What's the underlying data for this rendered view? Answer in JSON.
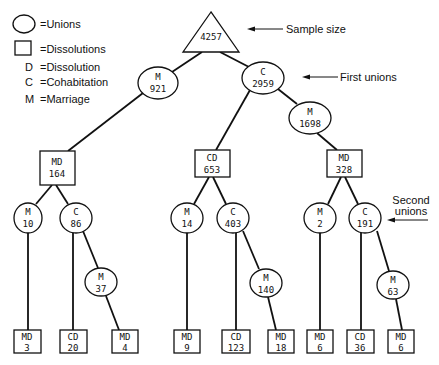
{
  "legend": {
    "unions": "=Unions",
    "dissolutions": "=Dissolutions",
    "d_letter": "D",
    "d_text": "=Dissolution",
    "c_letter": "C",
    "c_text": "=Cohabitation",
    "m_letter": "M",
    "m_text": "=Marriage"
  },
  "annotations": {
    "sample_size": "Sample size",
    "first_unions": "First unions",
    "second_unions_line1": "Second",
    "second_unions_line2": "unions"
  },
  "nodes": {
    "root": {
      "label": "4257"
    },
    "m921": {
      "type": "M",
      "count": "921"
    },
    "c2959": {
      "type": "C",
      "count": "2959"
    },
    "m1698": {
      "type": "M",
      "count": "1698"
    },
    "md164": {
      "type": "MD",
      "count": "164"
    },
    "cd653": {
      "type": "CD",
      "count": "653"
    },
    "md328": {
      "type": "MD",
      "count": "328"
    },
    "m10": {
      "type": "M",
      "count": "10"
    },
    "c86": {
      "type": "C",
      "count": "86"
    },
    "m37": {
      "type": "M",
      "count": "37"
    },
    "m14": {
      "type": "M",
      "count": "14"
    },
    "c403": {
      "type": "C",
      "count": "403"
    },
    "m140": {
      "type": "M",
      "count": "140"
    },
    "m2": {
      "type": "M",
      "count": "2"
    },
    "c191": {
      "type": "C",
      "count": "191"
    },
    "m63": {
      "type": "M",
      "count": "63"
    },
    "md3": {
      "type": "MD",
      "count": "3"
    },
    "cd20": {
      "type": "CD",
      "count": "20"
    },
    "md4": {
      "type": "MD",
      "count": "4"
    },
    "md9": {
      "type": "MD",
      "count": "9"
    },
    "cd123": {
      "type": "CD",
      "count": "123"
    },
    "md18": {
      "type": "MD",
      "count": "18"
    },
    "md6a": {
      "type": "MD",
      "count": "6"
    },
    "cd36": {
      "type": "CD",
      "count": "36"
    },
    "md6b": {
      "type": "MD",
      "count": "6"
    }
  }
}
